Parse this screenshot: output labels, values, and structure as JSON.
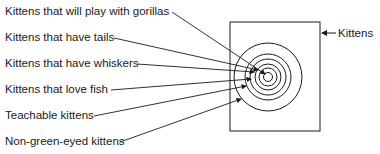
{
  "diagram": {
    "type": "nested-sets",
    "labels": [
      "Kittens that will play with gorillas",
      "Kittens that have tails",
      "Kittens that have whiskers",
      "Kittens that love fish",
      "Teachable kittens",
      "Non-green-eyed kittens"
    ],
    "universe_label": "Kittens"
  }
}
